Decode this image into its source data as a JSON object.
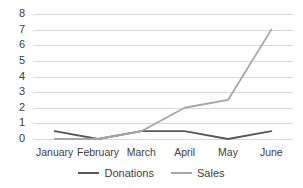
{
  "chart_data": {
    "type": "line",
    "title": "",
    "subtitle": "",
    "xlabel": "",
    "ylabel": "",
    "categories": [
      "January",
      "February",
      "March",
      "April",
      "May",
      "June"
    ],
    "series": [
      {
        "name": "Donations",
        "color": "#595959",
        "values": [
          0.5,
          0,
          0.5,
          0.5,
          0,
          0.5
        ]
      },
      {
        "name": "Sales",
        "color": "#a6a6a6",
        "values": [
          0,
          0,
          0.5,
          2,
          2.5,
          7
        ]
      }
    ],
    "ylim": [
      0,
      8
    ],
    "y_ticks": [
      0,
      1,
      2,
      3,
      4,
      5,
      6,
      7,
      8
    ],
    "y_tick_labels": [
      "0",
      "1",
      "2",
      "3",
      "4",
      "5",
      "6",
      "7",
      "8"
    ],
    "grid": true,
    "grid_axis": "y",
    "grid_color": "#d9d9d9",
    "legend_position": "bottom",
    "background": "#ffffff",
    "text_color": "#404040"
  }
}
